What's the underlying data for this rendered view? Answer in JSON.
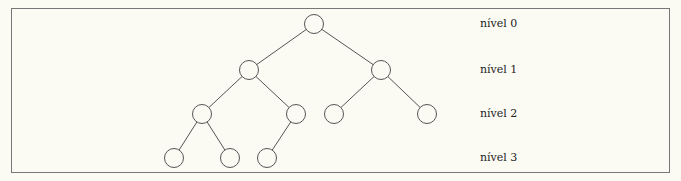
{
  "diagram": {
    "type": "binary-tree",
    "node_radius": 9.5,
    "stroke_color": "#555555",
    "background": "#fbfaf3",
    "nodes": [
      {
        "id": "n0",
        "level": 0,
        "x": 314,
        "y": 24
      },
      {
        "id": "n1",
        "level": 1,
        "x": 249,
        "y": 70
      },
      {
        "id": "n2",
        "level": 1,
        "x": 381,
        "y": 70
      },
      {
        "id": "n3",
        "level": 2,
        "x": 202,
        "y": 114
      },
      {
        "id": "n4",
        "level": 2,
        "x": 296,
        "y": 114
      },
      {
        "id": "n5",
        "level": 2,
        "x": 334,
        "y": 114
      },
      {
        "id": "n6",
        "level": 2,
        "x": 427,
        "y": 114
      },
      {
        "id": "n7",
        "level": 3,
        "x": 174,
        "y": 158
      },
      {
        "id": "n8",
        "level": 3,
        "x": 230,
        "y": 158
      },
      {
        "id": "n9",
        "level": 3,
        "x": 267,
        "y": 158
      }
    ],
    "edges": [
      [
        "n0",
        "n1"
      ],
      [
        "n0",
        "n2"
      ],
      [
        "n1",
        "n3"
      ],
      [
        "n1",
        "n4"
      ],
      [
        "n2",
        "n5"
      ],
      [
        "n2",
        "n6"
      ],
      [
        "n3",
        "n7"
      ],
      [
        "n3",
        "n8"
      ],
      [
        "n4",
        "n9"
      ]
    ],
    "levels": [
      {
        "label": "nível 0",
        "y": 24
      },
      {
        "label": "nível 1",
        "y": 70
      },
      {
        "label": "nível 2",
        "y": 114
      },
      {
        "label": "nível 3",
        "y": 158
      }
    ]
  }
}
